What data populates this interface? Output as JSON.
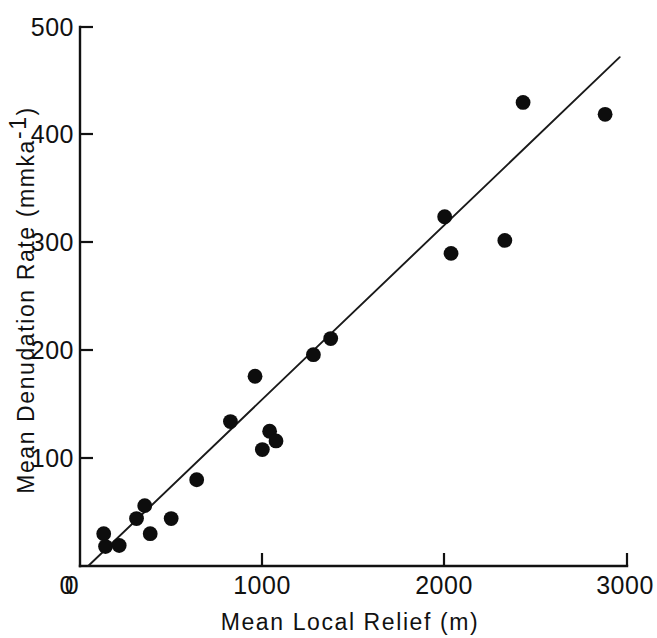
{
  "figure": {
    "background_color": "#ffffff",
    "ink_color": "#111111"
  },
  "chart_data": {
    "type": "scatter",
    "title": "",
    "xlabel": "Mean  Local  Relief  (m)",
    "ylabel": "Mean  Denudation  Rate  (mmka",
    "ylabel_exponent": "-1",
    "ylabel_suffix": ")",
    "xlim": [
      0,
      3000
    ],
    "ylim": [
      0,
      500
    ],
    "xticks": [
      0,
      1000,
      2000,
      3000
    ],
    "yticks": [
      0,
      100,
      200,
      300,
      400,
      500
    ],
    "xticklabels": [
      "0",
      "1000",
      "2000",
      "3000"
    ],
    "yticklabels": [
      "0",
      "100",
      "200",
      "300",
      "400",
      "500"
    ],
    "grid": false,
    "legend": "none",
    "marker": "filled-circle",
    "marker_color": "#0d0d0d",
    "points": [
      {
        "x": 130,
        "y": 30
      },
      {
        "x": 140,
        "y": 18
      },
      {
        "x": 215,
        "y": 19
      },
      {
        "x": 310,
        "y": 44
      },
      {
        "x": 355,
        "y": 56
      },
      {
        "x": 385,
        "y": 30
      },
      {
        "x": 500,
        "y": 44
      },
      {
        "x": 640,
        "y": 80
      },
      {
        "x": 825,
        "y": 134
      },
      {
        "x": 960,
        "y": 176
      },
      {
        "x": 1000,
        "y": 108
      },
      {
        "x": 1040,
        "y": 125
      },
      {
        "x": 1075,
        "y": 116
      },
      {
        "x": 1280,
        "y": 196
      },
      {
        "x": 1375,
        "y": 211
      },
      {
        "x": 2000,
        "y": 324
      },
      {
        "x": 2035,
        "y": 290
      },
      {
        "x": 2330,
        "y": 302
      },
      {
        "x": 2430,
        "y": 430
      },
      {
        "x": 2880,
        "y": 419
      }
    ],
    "trendline": {
      "type": "linear-fit",
      "x_start": 45,
      "y_start": 0,
      "x_end": 2960,
      "y_end": 472
    }
  }
}
